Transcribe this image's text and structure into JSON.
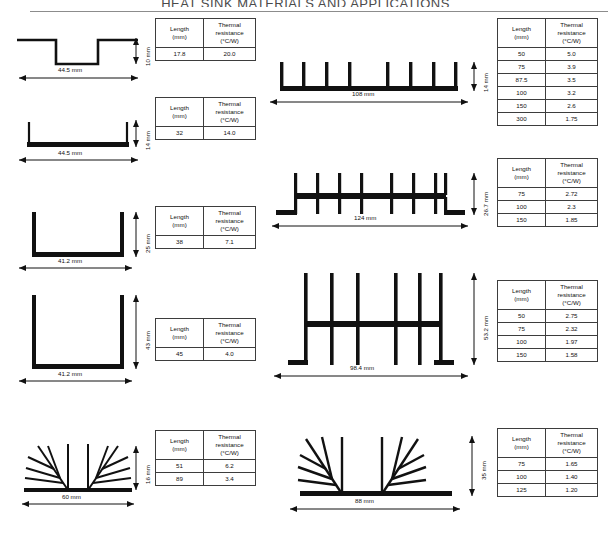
{
  "document": {
    "header_title": "HEAT SINK MATERIALS AND APPLICATIONS"
  },
  "table_headers": {
    "length": "Length",
    "length_unit": "(mm)",
    "resistance": "Thermal",
    "resistance_2": "resistance",
    "resistance_unit": "(°C/W)"
  },
  "figures": [
    {
      "id": "profile-1",
      "shape": "shallow-channel",
      "width_label": "44.5 mm",
      "height_label": "10 mm",
      "table": {
        "rows": [
          {
            "length": "17.8",
            "resistance": "20.0"
          }
        ]
      }
    },
    {
      "id": "profile-2",
      "shape": "u-channel-short",
      "width_label": "44.5 mm",
      "height_label": "14 mm",
      "table": {
        "rows": [
          {
            "length": "32",
            "resistance": "14.0"
          }
        ]
      }
    },
    {
      "id": "profile-3",
      "shape": "u-channel-medium",
      "width_label": "41.2 mm",
      "height_label": "25 mm",
      "table": {
        "rows": [
          {
            "length": "38",
            "resistance": "7.1"
          }
        ]
      }
    },
    {
      "id": "profile-4",
      "shape": "u-channel-tall",
      "width_label": "41.2 mm",
      "height_label": "43 mm",
      "table": {
        "rows": [
          {
            "length": "45",
            "resistance": "4.0"
          }
        ]
      }
    },
    {
      "id": "profile-5",
      "shape": "branched-fin-small",
      "width_label": "60 mm",
      "height_label": "16 mm",
      "table": {
        "rows": [
          {
            "length": "51",
            "resistance": "6.2"
          },
          {
            "length": "89",
            "resistance": "3.4"
          }
        ]
      }
    },
    {
      "id": "profile-6",
      "shape": "straight-fin-flat",
      "width_label": "108 mm",
      "height_label": "14 mm",
      "table": {
        "rows": [
          {
            "length": "50",
            "resistance": "5.0"
          },
          {
            "length": "75",
            "resistance": "3.9"
          },
          {
            "length": "87.5",
            "resistance": "3.5"
          },
          {
            "length": "100",
            "resistance": "3.2"
          },
          {
            "length": "150",
            "resistance": "2.6"
          },
          {
            "length": "300",
            "resistance": "1.75"
          }
        ]
      }
    },
    {
      "id": "profile-7",
      "shape": "double-sided-fin",
      "width_label": "124 mm",
      "height_label": "26.7 mm",
      "table": {
        "rows": [
          {
            "length": "75",
            "resistance": "2.72"
          },
          {
            "length": "100",
            "resistance": "2.3"
          },
          {
            "length": "150",
            "resistance": "1.85"
          }
        ]
      }
    },
    {
      "id": "profile-8",
      "shape": "tall-straight-fin",
      "width_label": "98.4 mm",
      "height_label": "53.2 mm",
      "table": {
        "rows": [
          {
            "length": "50",
            "resistance": "2.75"
          },
          {
            "length": "75",
            "resistance": "2.32"
          },
          {
            "length": "100",
            "resistance": "1.97"
          },
          {
            "length": "150",
            "resistance": "1.58"
          }
        ]
      }
    },
    {
      "id": "profile-9",
      "shape": "branched-fin-large",
      "width_label": "88 mm",
      "height_label": "35 mm",
      "table": {
        "rows": [
          {
            "length": "75",
            "resistance": "1.65"
          },
          {
            "length": "100",
            "resistance": "1.40"
          },
          {
            "length": "125",
            "resistance": "1.20"
          }
        ]
      }
    }
  ]
}
